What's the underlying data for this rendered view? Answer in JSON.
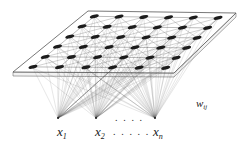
{
  "figure": {
    "background_color": "#ffffff",
    "ink_color": "#1a1a1a",
    "node_fill_color": "#1c1c1c",
    "lattice_line_color": "#808080",
    "fan_line_color": "#4d4d4d",
    "plane_edge_color": "#555555"
  },
  "labels": {
    "input_1": {
      "base": "x",
      "sub": "1",
      "x": 57,
      "y": 125
    },
    "input_2": {
      "base": "x",
      "sub": "2",
      "x": 95,
      "y": 125
    },
    "input_n": {
      "base": "x",
      "sub": "n",
      "x": 153,
      "y": 125
    },
    "weights": {
      "base": "w",
      "sub": "ij",
      "x": 196,
      "y": 98
    },
    "ellipsis_upper": {
      "text": ". . . .",
      "x": 115,
      "y": 112
    },
    "ellipsis_lower": {
      "text": ". . . . .",
      "x": 113,
      "y": 126
    }
  },
  "lattice": {
    "rows": 6,
    "cols": 6,
    "node_count": 36,
    "node_shape": "ellipse",
    "node_rx": 4.6,
    "node_ry": 1.7,
    "node_rotation_deg": -14,
    "plane_corners": {
      "top_left": [
        88,
        11
      ],
      "top_right": [
        236,
        13
      ],
      "bottom_right": [
        174,
        73
      ],
      "bottom_left": [
        13,
        72
      ]
    },
    "plane_thickness": 4
  },
  "inputs": {
    "count": 3,
    "nodes": [
      {
        "name": "x1",
        "x": 58,
        "y": 118
      },
      {
        "name": "x2",
        "x": 96,
        "y": 118
      },
      {
        "name": "xn",
        "x": 155,
        "y": 118
      }
    ]
  }
}
